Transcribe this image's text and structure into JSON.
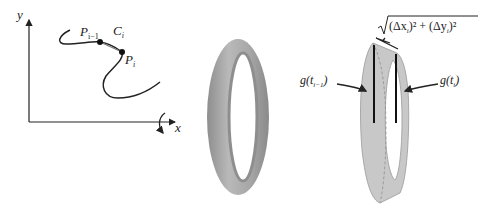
{
  "panel_left": {
    "axis_x_label": "x",
    "axis_y_label": "y",
    "point_prev": {
      "base": "P",
      "sub": "i−1"
    },
    "chord": {
      "base": "C",
      "sub": "i"
    },
    "point_curr": {
      "base": "P",
      "sub": "i"
    }
  },
  "panel_middle": {
    "description": "surface of revolution (torus-like band)"
  },
  "panel_right": {
    "arc_formula": {
      "open": "(Δx",
      "sub1": "i",
      "mid": ")² + (Δy",
      "sub2": "i",
      "close": ")²"
    },
    "left_label": {
      "pre": "g(t",
      "sub": "i−1",
      "post": ")"
    },
    "right_label": {
      "pre": "g(t",
      "sub": "i",
      "post": ")"
    }
  },
  "colors": {
    "band_fill": "#c8c8c8",
    "band_dark": "#9a9a9a",
    "ink": "#222222"
  }
}
